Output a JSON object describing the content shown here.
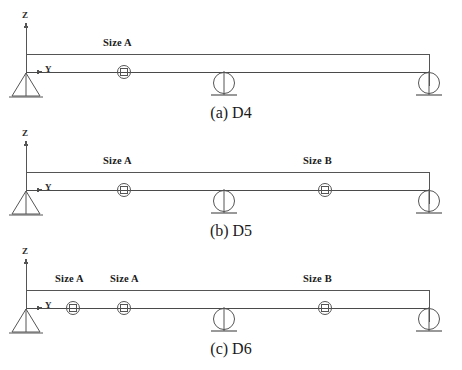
{
  "figure": {
    "panels": [
      {
        "id": "d4",
        "caption": "(a) D4",
        "axis_z": "Z",
        "axis_y": "Y",
        "segment_labels": [
          {
            "text": "Size A",
            "x": 103,
            "y": 37
          }
        ],
        "nodes": [
          {
            "name": "node-marker-1",
            "x": 124
          }
        ],
        "supports": [
          {
            "type": "pin",
            "name": "pin-support-left",
            "x": 26
          },
          {
            "type": "roller",
            "name": "roller-support-mid",
            "x": 224
          },
          {
            "type": "roller",
            "name": "roller-support-right",
            "x": 429
          }
        ]
      },
      {
        "id": "d5",
        "caption": "(b) D5",
        "axis_z": "Z",
        "axis_y": "Y",
        "segment_labels": [
          {
            "text": "Size A",
            "x": 103,
            "y": 37
          },
          {
            "text": "Size B",
            "x": 303,
            "y": 37
          }
        ],
        "nodes": [
          {
            "name": "node-marker-1",
            "x": 124
          },
          {
            "name": "node-marker-2",
            "x": 325
          }
        ],
        "supports": [
          {
            "type": "pin",
            "name": "pin-support-left",
            "x": 26
          },
          {
            "type": "roller",
            "name": "roller-support-mid",
            "x": 224
          },
          {
            "type": "roller",
            "name": "roller-support-right",
            "x": 429
          }
        ]
      },
      {
        "id": "d6",
        "caption": "(c) D6",
        "axis_z": "Z",
        "axis_y": "Y",
        "segment_labels": [
          {
            "text": "Size A",
            "x": 55,
            "y": 37
          },
          {
            "text": "Size A",
            "x": 110,
            "y": 37
          },
          {
            "text": "Size B",
            "x": 303,
            "y": 37
          }
        ],
        "nodes": [
          {
            "name": "node-marker-1",
            "x": 73
          },
          {
            "name": "node-marker-2",
            "x": 124
          },
          {
            "name": "node-marker-3",
            "x": 325
          }
        ],
        "supports": [
          {
            "type": "pin",
            "name": "pin-support-left",
            "x": 26
          },
          {
            "type": "roller",
            "name": "roller-support-mid",
            "x": 224
          },
          {
            "type": "roller",
            "name": "roller-support-right",
            "x": 429
          }
        ]
      }
    ],
    "geometry": {
      "beam_left_x": 26,
      "beam_right_x": 429,
      "beam_axis_y": 72,
      "top_line_y": 54,
      "z_axis_top_y": 22,
      "panel_tops": [
        0,
        118,
        236
      ],
      "caption_tops": [
        104,
        222,
        340
      ]
    },
    "colors": {
      "line": "#555555",
      "beam": "#4a4a4a",
      "text": "#1a1a1a",
      "background": "#ffffff"
    }
  }
}
